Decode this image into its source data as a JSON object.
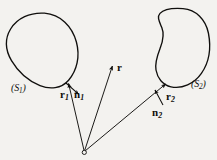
{
  "figure": {
    "background_color": "#f3f2ef",
    "ink_color": "#100f0d",
    "surfaces": [
      {
        "id": "S1",
        "label": "(S",
        "label_sub": "1",
        "label_close": ")",
        "shape": "egg-oval",
        "side": "left"
      },
      {
        "id": "S2",
        "label": "(S",
        "label_sub": "2",
        "label_close": ")",
        "shape": "kidney-bean",
        "side": "right"
      }
    ],
    "vectors": [
      {
        "id": "r1",
        "label": "r",
        "label_sub": "1",
        "kind": "position-vector",
        "from": "origin",
        "to": "surface-point-on-S1"
      },
      {
        "id": "r",
        "label": "r",
        "label_sub": "",
        "kind": "position-vector",
        "from": "origin",
        "to": "field-point"
      },
      {
        "id": "r2",
        "label": "r",
        "label_sub": "2",
        "kind": "position-vector",
        "from": "origin",
        "to": "surface-point-on-S2"
      },
      {
        "id": "n1",
        "label": "n",
        "label_sub": "1",
        "kind": "outward-normal",
        "at": "surface-point-on-S1"
      },
      {
        "id": "n2",
        "label": "n",
        "label_sub": "2",
        "kind": "outward-normal",
        "at": "surface-point-on-S2"
      }
    ],
    "origin": {
      "marker": "open-circle"
    }
  }
}
